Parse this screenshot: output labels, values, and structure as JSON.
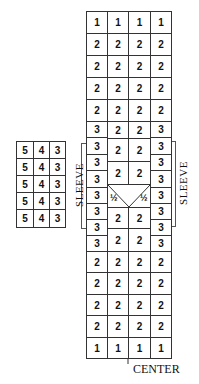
{
  "diagram": {
    "main_grid": {
      "top_rows": [
        [
          "1",
          "1",
          "1",
          "1"
        ],
        [
          "2",
          "2",
          "2",
          "2"
        ],
        [
          "2",
          "2",
          "2",
          "2"
        ],
        [
          "2",
          "2",
          "2",
          "2"
        ],
        [
          "2",
          "2",
          "2",
          "2"
        ]
      ],
      "side_column_values": [
        "3",
        "3",
        "3",
        "3",
        "3",
        "3",
        "3",
        "3"
      ],
      "center_blocks": [
        [
          "2",
          "2"
        ],
        [
          "2",
          "2"
        ],
        [
          "2",
          "2"
        ],
        [
          "½",
          "½"
        ],
        [
          "2",
          "2"
        ],
        [
          "2",
          "2"
        ]
      ],
      "bottom_rows": [
        [
          "2",
          "2",
          "2",
          "2"
        ],
        [
          "2",
          "2",
          "2",
          "2"
        ],
        [
          "2",
          "2",
          "2",
          "2"
        ],
        [
          "2",
          "2",
          "2",
          "2"
        ],
        [
          "1",
          "1",
          "1",
          "1"
        ]
      ]
    },
    "side_grid": {
      "rows": [
        [
          "5",
          "4",
          "3"
        ],
        [
          "5",
          "4",
          "3"
        ],
        [
          "5",
          "4",
          "3"
        ],
        [
          "5",
          "4",
          "3"
        ],
        [
          "5",
          "4",
          "3"
        ]
      ]
    },
    "labels": {
      "left_sleeve": "SLEEVE",
      "right_sleeve": "SLEEVE",
      "center": "CENTER"
    }
  }
}
